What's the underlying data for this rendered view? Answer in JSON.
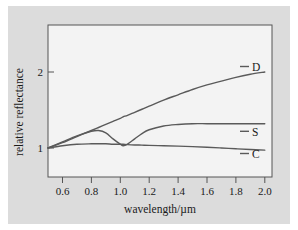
{
  "figure": {
    "background_color": "#ffffff",
    "panel_color": "#dcdcdc",
    "plot_area_color": "#f2f2f2",
    "line_color": "#5a5a5a",
    "text_color": "#1a1a1a"
  },
  "axes": {
    "xlabel": "wavelength/µm",
    "ylabel": "relative reflectance",
    "xticks": [
      "0.6",
      "0.8",
      "1.0",
      "1.2",
      "1.4",
      "1.6",
      "1.8",
      "2.0"
    ],
    "yticks": [
      "1",
      "2"
    ]
  },
  "labels": {
    "d": "D",
    "s": "S",
    "c": "C"
  },
  "chart_data": {
    "type": "line",
    "title": "",
    "xlabel": "wavelength/µm",
    "ylabel": "relative reflectance",
    "xlim": [
      0.5,
      2.05
    ],
    "ylim": [
      0.88,
      2.5
    ],
    "xticks": [
      0.6,
      0.8,
      1.0,
      1.2,
      1.4,
      1.6,
      1.8,
      2.0
    ],
    "yticks": [
      1,
      2
    ],
    "grid": false,
    "legend": "inline-right-end-labels",
    "x": [
      0.5,
      0.6,
      0.7,
      0.8,
      0.85,
      0.9,
      0.95,
      1.0,
      1.02,
      1.05,
      1.1,
      1.15,
      1.2,
      1.3,
      1.4,
      1.5,
      1.6,
      1.7,
      1.8,
      1.9,
      2.0
    ],
    "series": [
      {
        "name": "D",
        "label": "D",
        "values": [
          1.0,
          1.07,
          1.15,
          1.23,
          1.27,
          1.31,
          1.35,
          1.39,
          1.41,
          1.43,
          1.47,
          1.51,
          1.55,
          1.63,
          1.7,
          1.77,
          1.83,
          1.88,
          1.93,
          1.97,
          2.0
        ]
      },
      {
        "name": "S",
        "label": "S",
        "values": [
          1.0,
          1.08,
          1.16,
          1.22,
          1.23,
          1.2,
          1.12,
          1.05,
          1.03,
          1.05,
          1.12,
          1.19,
          1.24,
          1.29,
          1.31,
          1.32,
          1.32,
          1.32,
          1.32,
          1.32,
          1.32
        ]
      },
      {
        "name": "C",
        "label": "C",
        "values": [
          1.0,
          1.03,
          1.05,
          1.055,
          1.055,
          1.055,
          1.05,
          1.05,
          1.05,
          1.045,
          1.04,
          1.038,
          1.035,
          1.03,
          1.025,
          1.018,
          1.01,
          1.0,
          0.99,
          0.98,
          0.972
        ]
      }
    ]
  }
}
